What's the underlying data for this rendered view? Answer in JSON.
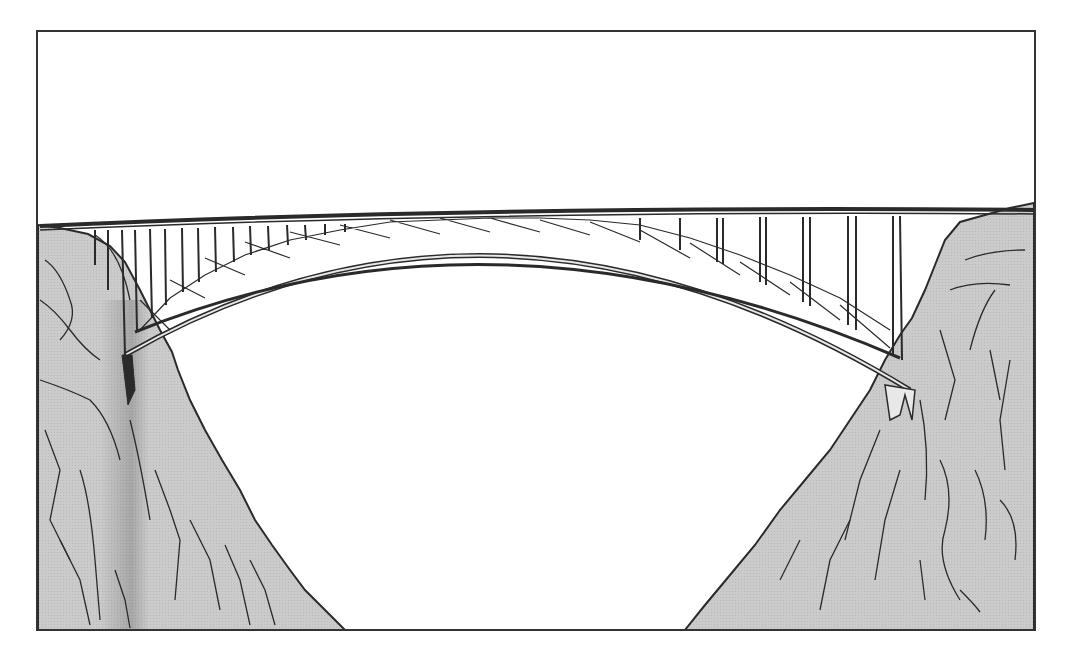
{
  "illustration": {
    "subject": "Steel arch bridge spanning a rocky gorge",
    "alt": "Line drawing of a deck arch bridge crossing between two gray rock cliffs",
    "frame": {
      "x": 37,
      "y": 31,
      "width": 998,
      "height": 599,
      "stroke": "#333333"
    },
    "colors": {
      "background": "#ffffff",
      "rock_fill": "#c9c9c9",
      "rock_shadow": "#a8a8a8",
      "ink": "#2a2a2a",
      "steel_light": "#e8e8e8"
    },
    "elements": {
      "deck": "Straight road deck across the top",
      "arch": "Braced steel truss arch",
      "columns": "Vertical spandrel columns between deck and arch",
      "left_cliff": "Left gray rock cliff",
      "right_cliff": "Right gray rock cliff"
    }
  }
}
